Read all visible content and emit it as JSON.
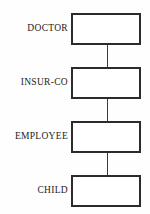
{
  "diagram": {
    "type": "vertical-chain",
    "title": "",
    "background_color": "#fefefe",
    "box_border_color": "#2b2b2b",
    "connector_color": "#3a3a3a",
    "text_color": "#1c1c1c",
    "nodes": [
      {
        "label": "DOCTOR",
        "box_text": "",
        "top": 13
      },
      {
        "label": "INSUR-CO",
        "box_text": "",
        "top": 67
      },
      {
        "label": "EMPLOYEE",
        "box_text": "",
        "top": 121
      },
      {
        "label": "CHILD",
        "box_text": "",
        "top": 175
      }
    ],
    "connectors": [
      {
        "from": "DOCTOR",
        "to": "INSUR-CO",
        "top": 45,
        "height": 22
      },
      {
        "from": "INSUR-CO",
        "to": "EMPLOYEE",
        "top": 99,
        "height": 22
      },
      {
        "from": "EMPLOYEE",
        "to": "CHILD",
        "top": 153,
        "height": 22
      }
    ]
  }
}
